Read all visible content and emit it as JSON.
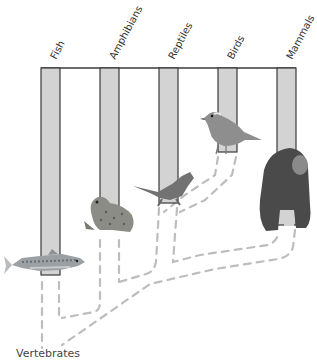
{
  "header": {
    "partial_title_cut_off": ""
  },
  "root_label": "Vertebrates",
  "taxa": [
    {
      "name": "Fish",
      "animal": "trout"
    },
    {
      "name": "Amphibians",
      "animal": "frog"
    },
    {
      "name": "Reptiles",
      "animal": "lizard"
    },
    {
      "name": "Birds",
      "animal": "songbird"
    },
    {
      "name": "Mammals",
      "animal": "chimpanzee"
    }
  ],
  "colors": {
    "bar_fill": "#d3d3d3",
    "bar_stroke": "#3a3a3a",
    "dash_line": "#bdbdbd",
    "label_text": "#333333"
  }
}
